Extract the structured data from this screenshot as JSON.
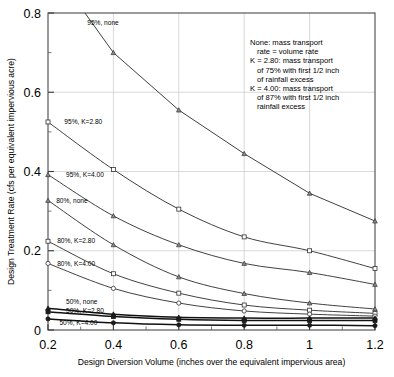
{
  "chart_data": {
    "type": "line",
    "title": "",
    "xlabel": "Design Diversion Volume (inches over the equivalent impervious area)",
    "ylabel": "Design Treatment Rate (cfs per equivalent impervious acre)",
    "xlim": [
      0.2,
      1.2
    ],
    "ylim": [
      0,
      0.8
    ],
    "xticks": [
      "0.2",
      "0.4",
      "0.6",
      "0.8",
      "1",
      "1.2"
    ],
    "xtick_values": [
      0.2,
      0.4,
      0.6,
      0.8,
      1.0,
      1.2
    ],
    "yticks": [
      "0",
      "0.2",
      "0.4",
      "0.6",
      "0.8"
    ],
    "ytick_values": [
      0,
      0.2,
      0.4,
      0.6,
      0.8
    ],
    "xminor_values": [
      0.3,
      0.5,
      0.7,
      0.9,
      1.1
    ],
    "yminor_values": [
      0.1,
      0.3,
      0.5,
      0.7
    ],
    "grid": true,
    "legend_position": "inline-labels",
    "marker_points_x": [
      0.2,
      0.4,
      0.6,
      0.8,
      1.0,
      1.2
    ],
    "series": [
      {
        "name": "95%, none",
        "marker": "triangle",
        "label_x": 0.32,
        "label_y": 0.775,
        "x": [
          0.2,
          0.4,
          0.6,
          0.8,
          1.0,
          1.2
        ],
        "values": [
          0.93,
          0.7,
          0.555,
          0.445,
          0.345,
          0.275
        ]
      },
      {
        "name": "95%, K=2.80",
        "marker": "square",
        "label_x": 0.25,
        "label_y": 0.525,
        "x": [
          0.2,
          0.4,
          0.6,
          0.8,
          1.0,
          1.2
        ],
        "values": [
          0.525,
          0.405,
          0.305,
          0.235,
          0.2,
          0.155
        ]
      },
      {
        "name": "95%, K=4.00",
        "marker": "triangle",
        "label_x": 0.255,
        "label_y": 0.392,
        "x": [
          0.2,
          0.4,
          0.6,
          0.8,
          1.0,
          1.2
        ],
        "values": [
          0.392,
          0.288,
          0.215,
          0.168,
          0.145,
          0.115
        ]
      },
      {
        "name": "80%, none",
        "marker": "triangle",
        "label_x": 0.225,
        "label_y": 0.327,
        "x": [
          0.2,
          0.4,
          0.6,
          0.8,
          1.0,
          1.2
        ],
        "values": [
          0.327,
          0.215,
          0.134,
          0.092,
          0.068,
          0.053
        ]
      },
      {
        "name": "80%, K=2.80",
        "marker": "square",
        "label_x": 0.228,
        "label_y": 0.224,
        "x": [
          0.2,
          0.4,
          0.6,
          0.8,
          1.0,
          1.2
        ],
        "values": [
          0.224,
          0.142,
          0.093,
          0.063,
          0.05,
          0.042
        ]
      },
      {
        "name": "80%, K=4.00",
        "marker": "circle",
        "label_x": 0.228,
        "label_y": 0.168,
        "x": [
          0.2,
          0.4,
          0.6,
          0.8,
          1.0,
          1.2
        ],
        "values": [
          0.168,
          0.105,
          0.068,
          0.048,
          0.04,
          0.035
        ]
      },
      {
        "name": "50%, none",
        "marker": "triangle",
        "label_x": 0.255,
        "label_y": 0.07,
        "x": [
          0.2,
          0.4,
          0.6,
          0.8,
          1.0,
          1.2
        ],
        "values": [
          0.055,
          0.04,
          0.032,
          0.03,
          0.03,
          0.03
        ]
      },
      {
        "name": "50%, K=2.80",
        "marker": "square",
        "label_x": 0.255,
        "label_y": 0.049,
        "x": [
          0.2,
          0.4,
          0.6,
          0.8,
          1.0,
          1.2
        ],
        "values": [
          0.046,
          0.034,
          0.027,
          0.024,
          0.024,
          0.024
        ]
      },
      {
        "name": "50%, K=4.00",
        "marker": "circle",
        "label_x": 0.235,
        "label_y": 0.018,
        "x": [
          0.2,
          0.4,
          0.6,
          0.8,
          1.0,
          1.2
        ],
        "values": [
          0.028,
          0.018,
          0.013,
          0.012,
          0.012,
          0.011
        ]
      }
    ],
    "annotations": [
      "None: mass transport",
      "   rate = volume rate",
      "K = 2.80: mass transport",
      "   of 75% with first 1/2 inch",
      "   of rainfall excess",
      "K = 4.00: mass transport",
      "   of 87% with first 1/2 inch",
      "   rainfall excess"
    ]
  }
}
